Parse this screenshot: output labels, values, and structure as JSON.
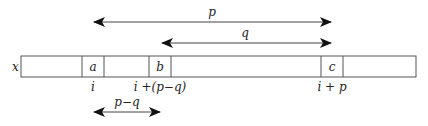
{
  "diagram": {
    "array_label": "x",
    "cells": [
      {
        "label": "a",
        "x1": 82,
        "x2": 104
      },
      {
        "label": "b",
        "x1": 149,
        "x2": 171
      },
      {
        "label": "c",
        "x1": 321,
        "x2": 343
      }
    ],
    "index_labels": [
      {
        "text": "i",
        "x": 93
      },
      {
        "text": "i +(p−q)",
        "x": 160
      },
      {
        "text": "i + p",
        "x": 332
      }
    ],
    "arrows": [
      {
        "name": "p",
        "label": "p",
        "y": 22,
        "x1": 92,
        "x2": 333
      },
      {
        "name": "q",
        "label": "q",
        "y": 43,
        "x1": 160,
        "x2": 333
      },
      {
        "name": "p-minus-q",
        "label": "p−q",
        "y": 112,
        "x1": 92,
        "x2": 162
      }
    ],
    "colors": {
      "stroke": "#333333",
      "text": "#222222"
    }
  }
}
